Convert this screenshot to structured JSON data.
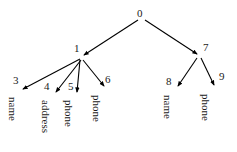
{
  "diagram": {
    "type": "tree",
    "title": "",
    "background_color": "#ffffff",
    "edge_color": "#000000",
    "text_color": "#1a1a1a",
    "nodes": [
      {
        "id": "0",
        "label": "0",
        "word": "",
        "x": 141,
        "y": 14,
        "label_x": 137,
        "label_y": 8,
        "word_x": 0,
        "word_y": 0
      },
      {
        "id": "1",
        "label": "1",
        "word": "",
        "x": 82,
        "y": 57,
        "label_x": 74,
        "label_y": 43,
        "word_x": 0,
        "word_y": 0
      },
      {
        "id": "7",
        "label": "7",
        "word": "",
        "x": 199,
        "y": 56,
        "label_x": 203,
        "label_y": 42,
        "word_x": 0,
        "word_y": 0
      },
      {
        "id": "3",
        "label": "3",
        "word": "name",
        "x": 22,
        "y": 90,
        "label_x": 13,
        "label_y": 75,
        "word_x": 18,
        "word_y": 97
      },
      {
        "id": "4",
        "label": "4",
        "word": "address",
        "x": 55,
        "y": 94,
        "label_x": 44,
        "label_y": 81,
        "word_x": 51,
        "word_y": 100
      },
      {
        "id": "5",
        "label": "5",
        "word": "phone",
        "x": 77,
        "y": 94,
        "label_x": 68,
        "label_y": 81,
        "word_x": 74,
        "word_y": 100
      },
      {
        "id": "6",
        "label": "6",
        "word": "phone",
        "x": 105,
        "y": 88,
        "label_x": 105,
        "label_y": 74,
        "word_x": 102,
        "word_y": 95
      },
      {
        "id": "8",
        "label": "8",
        "word": "name",
        "x": 177,
        "y": 88,
        "label_x": 166,
        "label_y": 76,
        "word_x": 173,
        "word_y": 95
      },
      {
        "id": "9",
        "label": "9",
        "word": "phone",
        "x": 215,
        "y": 87,
        "label_x": 219,
        "label_y": 71,
        "word_x": 211,
        "word_y": 94
      }
    ],
    "edges": [
      {
        "from": "0",
        "to": "1",
        "x1": 138,
        "y1": 20,
        "x2": 84,
        "y2": 55
      },
      {
        "from": "0",
        "to": "7",
        "x1": 145,
        "y1": 20,
        "x2": 197,
        "y2": 54
      },
      {
        "from": "1",
        "to": "3",
        "x1": 80,
        "y1": 59,
        "x2": 23,
        "y2": 89
      },
      {
        "from": "1",
        "to": "4",
        "x1": 81,
        "y1": 60,
        "x2": 56,
        "y2": 92
      },
      {
        "from": "1",
        "to": "5",
        "x1": 80,
        "y1": 60,
        "x2": 77,
        "y2": 92
      },
      {
        "from": "1",
        "to": "6",
        "x1": 83,
        "y1": 60,
        "x2": 104,
        "y2": 86
      },
      {
        "from": "7",
        "to": "8",
        "x1": 197,
        "y1": 58,
        "x2": 178,
        "y2": 86
      },
      {
        "from": "7",
        "to": "9",
        "x1": 201,
        "y1": 58,
        "x2": 214,
        "y2": 85
      }
    ]
  }
}
